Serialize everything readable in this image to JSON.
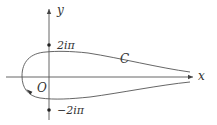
{
  "diagram": {
    "type": "contour-plot",
    "axes": {
      "x_label": "x",
      "y_label": "y",
      "origin_label": "O"
    },
    "marked_points": [
      {
        "label": "2iπ",
        "position": "positive-imaginary-axis"
      },
      {
        "label": "−2iπ",
        "position": "negative-imaginary-axis"
      }
    ],
    "contour": {
      "label": "C",
      "description": "Hankel-type loop: comes in from +∞ along lower side, circles the origin to the left enclosing it (passing between ±2iπ), and returns to +∞ along the upper side",
      "direction_marker": "arrow on lower-left arc"
    },
    "colors": {
      "stroke": "#555555",
      "text": "#333333",
      "background": "#ffffff"
    }
  }
}
